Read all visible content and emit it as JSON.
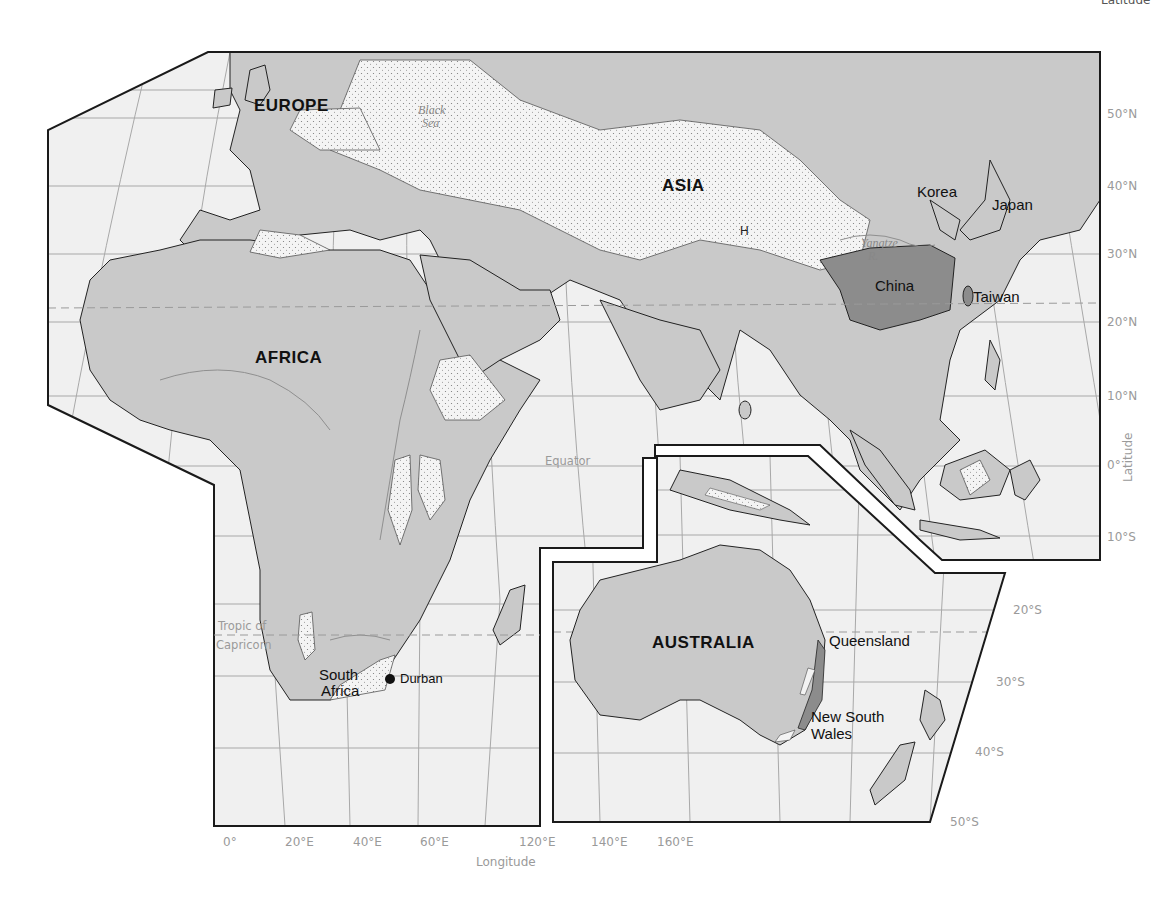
{
  "header": {
    "partial_title": "Latitude"
  },
  "regions": {
    "europe": "EUROPE",
    "asia": "ASIA",
    "africa": "AFRICA",
    "australia": "AUSTRALIA"
  },
  "places": {
    "korea": "Korea",
    "japan": "Japan",
    "china": "China",
    "taiwan": "Taiwan",
    "south_africa_1": "South",
    "south_africa_2": "Africa",
    "durban": "Durban",
    "queensland": "Queensland",
    "nsw_1": "New South",
    "nsw_2": "Wales",
    "highlands_marker": "H"
  },
  "water": {
    "black_sea_1": "Black",
    "black_sea_2": "Sea",
    "yangtze_1": "Yangtze",
    "yangtze_2": "R."
  },
  "reference_lines": {
    "equator": "Equator",
    "tropic_1": "Tropic of",
    "tropic_2": "Capricorn"
  },
  "axes": {
    "latitude_label": "Latitude",
    "longitude_label": "Longitude",
    "latitude_ticks": [
      "50°N",
      "40°N",
      "30°N",
      "20°N",
      "10°N",
      "0°",
      "10°S",
      "20°S",
      "30°S",
      "40°S",
      "50°S"
    ],
    "longitude_ticks": [
      "0°",
      "20°E",
      "40°E",
      "60°E",
      "120°E",
      "140°E",
      "160°E"
    ]
  },
  "colors": {
    "land": "#c9c9c9",
    "highland": "#f3f3f3",
    "highlight": "#8c8c8c",
    "ocean": "#efefef",
    "frame": "#1a1a1a",
    "grid": "#9a9a9a",
    "axis_text": "#9a9a9a"
  }
}
